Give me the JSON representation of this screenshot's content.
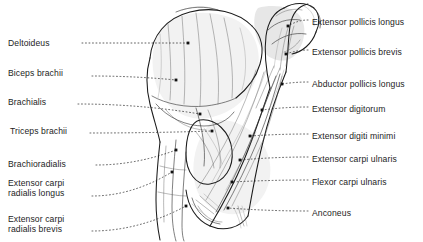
{
  "figure": {
    "view": "lateral-posterior flexed arm",
    "style": "black and white line drawing",
    "background_color": "#ffffff",
    "ink_color": "#1b1b1b",
    "leader_line_style": "dotted",
    "leader_endpoint_marker": "square-dot"
  },
  "labels_left": [
    {
      "id": "deltoideus",
      "text": "Deltoideus",
      "text2": "",
      "x": 8,
      "y": 38,
      "lead_from_x": 82,
      "lead_to_x": 188,
      "lead_from_y": 43,
      "lead_to_y": 43
    },
    {
      "id": "biceps-brachii",
      "text": "Biceps brachii",
      "text2": "",
      "x": 8,
      "y": 68,
      "lead_from_x": 92,
      "lead_to_x": 176,
      "lead_from_y": 76,
      "lead_to_y": 80
    },
    {
      "id": "brachialis",
      "text": "Brachialis",
      "text2": "",
      "x": 8,
      "y": 97,
      "lead_from_x": 78,
      "lead_to_x": 200,
      "lead_from_y": 104,
      "lead_to_y": 114
    },
    {
      "id": "triceps-brachii",
      "text": "Triceps brachii",
      "text2": "",
      "x": 10,
      "y": 126,
      "lead_from_x": 90,
      "lead_to_x": 212,
      "lead_from_y": 133,
      "lead_to_y": 131
    },
    {
      "id": "brachioradialis",
      "text": "Brachioradialis",
      "text2": "",
      "x": 8,
      "y": 159,
      "lead_from_x": 96,
      "lead_to_x": 176,
      "lead_from_y": 165,
      "lead_to_y": 150
    },
    {
      "id": "extensor-carpi-radialis-longus",
      "text": "Extensor carpi",
      "text2": "radialis longus",
      "x": 8,
      "y": 178,
      "lead_from_x": 92,
      "lead_to_x": 172,
      "lead_from_y": 196,
      "lead_to_y": 172
    },
    {
      "id": "extensor-carpi-radialis-brevis",
      "text": "Extensor carpi",
      "text2": "radialis brevis",
      "x": 8,
      "y": 214,
      "lead_from_x": 92,
      "lead_to_x": 186,
      "lead_from_y": 231,
      "lead_to_y": 206
    }
  ],
  "labels_right": [
    {
      "id": "extensor-pollicis-longus",
      "text": "Extensor pollicis longus",
      "x": 312,
      "y": 17,
      "lead_from_x": 308,
      "lead_to_x": 288,
      "lead_from_y": 20,
      "lead_to_y": 26
    },
    {
      "id": "extensor-pollicis-brevis",
      "text": "Extensor pollicis brevis",
      "x": 312,
      "y": 47,
      "lead_from_x": 308,
      "lead_to_x": 286,
      "lead_from_y": 50,
      "lead_to_y": 54
    },
    {
      "id": "abductor-pollicis-longus",
      "text": "Abductor pollicis longus",
      "x": 312,
      "y": 79,
      "lead_from_x": 308,
      "lead_to_x": 282,
      "lead_from_y": 82,
      "lead_to_y": 84
    },
    {
      "id": "extensor-digitorum",
      "text": "Extensor digitorum",
      "x": 312,
      "y": 104,
      "lead_from_x": 308,
      "lead_to_x": 262,
      "lead_from_y": 107,
      "lead_to_y": 110
    },
    {
      "id": "extensor-digiti-minimi",
      "text": "Extensor digiti minimi",
      "x": 312,
      "y": 131,
      "lead_from_x": 308,
      "lead_to_x": 250,
      "lead_from_y": 134,
      "lead_to_y": 136
    },
    {
      "id": "extensor-carpi-ulnaris",
      "text": "Extensor carpi ulnaris",
      "x": 312,
      "y": 154,
      "lead_from_x": 308,
      "lead_to_x": 240,
      "lead_from_y": 157,
      "lead_to_y": 160
    },
    {
      "id": "flexor-carpi-ulnaris",
      "text": "Flexor carpi ulnaris",
      "x": 312,
      "y": 177,
      "lead_from_x": 308,
      "lead_to_x": 232,
      "lead_from_y": 180,
      "lead_to_y": 182
    },
    {
      "id": "anconeus",
      "text": "Anconeus",
      "x": 312,
      "y": 208,
      "lead_from_x": 308,
      "lead_to_x": 228,
      "lead_from_y": 211,
      "lead_to_y": 208
    }
  ]
}
